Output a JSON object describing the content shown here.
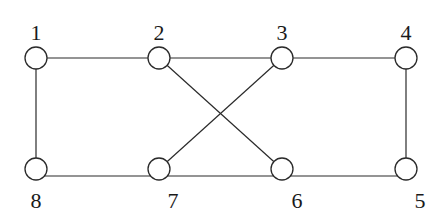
{
  "diagram": {
    "type": "graph",
    "nodes": [
      {
        "id": "1",
        "label": "1",
        "x": 36,
        "y": 58,
        "label_x": 36,
        "label_y": 40
      },
      {
        "id": "2",
        "label": "2",
        "x": 159,
        "y": 58,
        "label_x": 159,
        "label_y": 40
      },
      {
        "id": "3",
        "label": "3",
        "x": 282,
        "y": 58,
        "label_x": 282,
        "label_y": 40
      },
      {
        "id": "4",
        "label": "4",
        "x": 406,
        "y": 58,
        "label_x": 406,
        "label_y": 40
      },
      {
        "id": "5",
        "label": "5",
        "x": 406,
        "y": 169,
        "label_x": 420,
        "label_y": 208
      },
      {
        "id": "6",
        "label": "6",
        "x": 282,
        "y": 169,
        "label_x": 297,
        "label_y": 208
      },
      {
        "id": "7",
        "label": "7",
        "x": 159,
        "y": 169,
        "label_x": 173,
        "label_y": 208
      },
      {
        "id": "8",
        "label": "8",
        "x": 36,
        "y": 169,
        "label_x": 36,
        "label_y": 208
      }
    ],
    "edges": [
      {
        "from": "1",
        "to": "2"
      },
      {
        "from": "2",
        "to": "3"
      },
      {
        "from": "3",
        "to": "4"
      },
      {
        "from": "1",
        "to": "8"
      },
      {
        "from": "4",
        "to": "5"
      },
      {
        "from": "8",
        "to": "7"
      },
      {
        "from": "7",
        "to": "6"
      },
      {
        "from": "6",
        "to": "5"
      },
      {
        "from": "2",
        "to": "6"
      },
      {
        "from": "3",
        "to": "7"
      }
    ],
    "node_radius": 11
  }
}
